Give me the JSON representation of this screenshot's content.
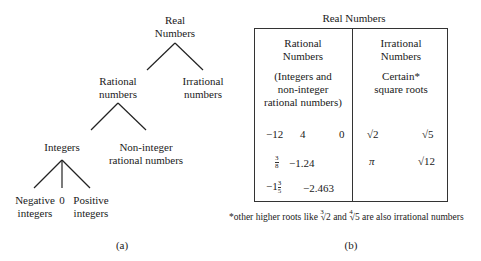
{
  "diagram_a": {
    "caption": "(a)",
    "nodes": {
      "real": [
        "Real",
        "Numbers"
      ],
      "rational": [
        "Rational",
        "numbers"
      ],
      "irrational": [
        "Irrational",
        "numbers"
      ],
      "integers": [
        "Integers"
      ],
      "non_integer": [
        "Non-integer",
        "rational numbers"
      ],
      "negative": [
        "Negative",
        "integers"
      ],
      "zero": [
        "0"
      ],
      "positive": [
        "Positive",
        "integers"
      ]
    }
  },
  "diagram_b": {
    "caption": "(b)",
    "title": "Real Numbers",
    "rational": {
      "heading": [
        "Rational",
        "Numbers"
      ],
      "desc": [
        "(Integers and",
        "non-integer",
        "rational numbers)"
      ],
      "examples": {
        "r1": [
          "−12",
          "4",
          "0"
        ],
        "r2_frac": {
          "num": "3",
          "den": "8"
        },
        "r2_val": "−1.24",
        "r3_whole": "−1",
        "r3_frac": {
          "num": "3",
          "den": "5"
        },
        "r3_val": "−2.463"
      }
    },
    "irrational": {
      "heading": [
        "Irrational",
        "Numbers"
      ],
      "desc": [
        "Certain*",
        "square roots"
      ],
      "examples": {
        "sqrt2": "√2",
        "sqrt5": "√5",
        "pi": "π",
        "sqrt12": "√12"
      }
    },
    "footnote": {
      "pre": "*other higher roots like ",
      "root1_idx": "3",
      "root1": "√2",
      "mid": " and ",
      "root2_idx": "4",
      "root2": "√5",
      "post": " are also irrational numbers"
    }
  }
}
